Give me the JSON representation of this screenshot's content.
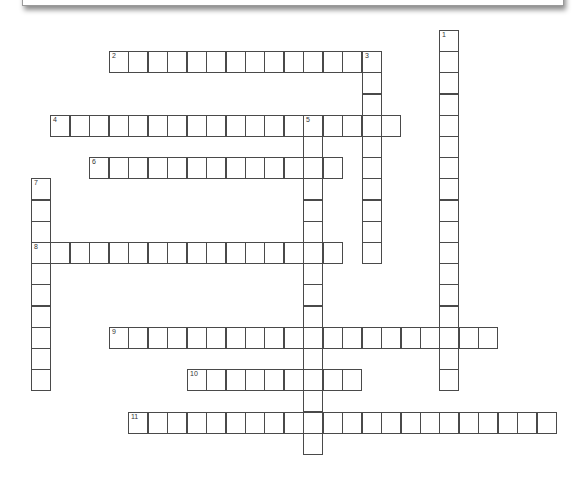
{
  "puzzle": {
    "cell_width": 19.45,
    "cell_height": 21.2,
    "origin_x": 31,
    "origin_y": 30,
    "words": [
      {
        "number": "1",
        "direction": "down",
        "col": 21,
        "row": 0,
        "length": 17
      },
      {
        "number": "2",
        "direction": "across",
        "col": 4,
        "row": 1,
        "length": 14
      },
      {
        "number": "3",
        "direction": "down",
        "col": 17,
        "row": 1,
        "length": 10
      },
      {
        "number": "4",
        "direction": "across",
        "col": 1,
        "row": 4,
        "length": 18
      },
      {
        "number": "5",
        "direction": "down",
        "col": 14,
        "row": 4,
        "length": 16
      },
      {
        "number": "6",
        "direction": "across",
        "col": 3,
        "row": 6,
        "length": 13
      },
      {
        "number": "7",
        "direction": "down",
        "col": 0,
        "row": 7,
        "length": 10
      },
      {
        "number": "8",
        "direction": "across",
        "col": 0,
        "row": 10,
        "length": 16
      },
      {
        "number": "9",
        "direction": "across",
        "col": 4,
        "row": 14,
        "length": 20
      },
      {
        "number": "10",
        "direction": "across",
        "col": 8,
        "row": 16,
        "length": 9
      },
      {
        "number": "11",
        "direction": "across",
        "col": 5,
        "row": 18,
        "length": 22
      }
    ]
  }
}
